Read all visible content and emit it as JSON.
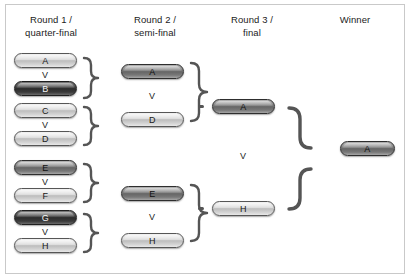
{
  "diagram": {
    "versus_label": "V"
  },
  "columns": [
    {
      "id": "round1",
      "header": "Round 1 /\nquarter-final"
    },
    {
      "id": "round2",
      "header": "Round 2 /\nsemi-final"
    },
    {
      "id": "round3",
      "header": "Round 3 /\nfinal"
    },
    {
      "id": "winner",
      "header": "Winner"
    }
  ],
  "round1": {
    "matches": [
      {
        "home": "A",
        "home_tone": "light",
        "away": "B",
        "away_tone": "dark",
        "vs": "V"
      },
      {
        "home": "C",
        "home_tone": "light",
        "away": "D",
        "away_tone": "light",
        "vs": "V"
      },
      {
        "home": "E",
        "home_tone": "midark",
        "away": "F",
        "away_tone": "light",
        "vs": "V"
      },
      {
        "home": "G",
        "home_tone": "dark",
        "away": "H",
        "away_tone": "light",
        "vs": "V"
      }
    ]
  },
  "round2": {
    "matches": [
      {
        "home": "A",
        "home_tone": "midark",
        "away": "D",
        "away_tone": "light",
        "vs": "V"
      },
      {
        "home": "E",
        "home_tone": "midark",
        "away": "H",
        "away_tone": "light",
        "vs": "V"
      }
    ]
  },
  "round3": {
    "matches": [
      {
        "home": "A",
        "home_tone": "midark",
        "away": "H",
        "away_tone": "light",
        "vs": "V"
      }
    ]
  },
  "winner": {
    "team": "A",
    "tone": "midark"
  },
  "colors": {
    "page_background": "#ffffff",
    "card_border": "#c9c9c9",
    "text": "#1b1b1b",
    "connector": "#555555",
    "pill_light": "#dcdcdc",
    "pill_mid": "#a8a8a8",
    "pill_midark": "#858585",
    "pill_dark": "#3a3a3a"
  }
}
